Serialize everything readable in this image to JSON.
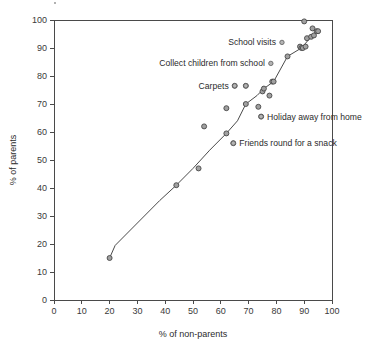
{
  "chart_data": {
    "type": "scatter",
    "title": "",
    "subtitle": "",
    "xlabel": "% of non-parents",
    "ylabel": "% of parents",
    "xlim": [
      0,
      100
    ],
    "ylim": [
      0,
      100
    ],
    "xticks": [
      "0",
      "10",
      "20",
      "30",
      "40",
      "50",
      "60",
      "70",
      "80",
      "90",
      "100"
    ],
    "yticks": [
      "0",
      "10",
      "20",
      "30",
      "40",
      "50",
      "60",
      "70",
      "80",
      "90",
      "100"
    ],
    "grid": false,
    "legend_position": "none",
    "marker_color": "#a0a0a0",
    "marker_edge_color": "#474747",
    "line_color": "#4a4a4a",
    "axis_color": "#4a4a4a",
    "series": [
      {
        "name": "activities",
        "points": [
          {
            "x": 20.0,
            "y": 15.0
          },
          {
            "x": 44.0,
            "y": 41.0
          },
          {
            "x": 52.0,
            "y": 47.0
          },
          {
            "x": 54.0,
            "y": 62.0
          },
          {
            "x": 62.0,
            "y": 59.5
          },
          {
            "x": 62.0,
            "y": 68.5
          },
          {
            "x": 64.5,
            "y": 56.0
          },
          {
            "x": 65.0,
            "y": 76.5
          },
          {
            "x": 69.0,
            "y": 76.5
          },
          {
            "x": 69.0,
            "y": 70.0
          },
          {
            "x": 73.5,
            "y": 69.0
          },
          {
            "x": 74.5,
            "y": 65.5
          },
          {
            "x": 75.0,
            "y": 74.5
          },
          {
            "x": 75.5,
            "y": 75.5
          },
          {
            "x": 77.5,
            "y": 73.0
          },
          {
            "x": 78.5,
            "y": 78.0
          },
          {
            "x": 79.0,
            "y": 78.0
          },
          {
            "x": 84.0,
            "y": 87.0
          },
          {
            "x": 88.5,
            "y": 90.5
          },
          {
            "x": 89.0,
            "y": 90.0
          },
          {
            "x": 89.5,
            "y": 90.0
          },
          {
            "x": 90.0,
            "y": 99.5
          },
          {
            "x": 90.5,
            "y": 90.5
          },
          {
            "x": 91.0,
            "y": 93.5
          },
          {
            "x": 92.5,
            "y": 94.0
          },
          {
            "x": 93.0,
            "y": 97.0
          },
          {
            "x": 93.5,
            "y": 94.5
          },
          {
            "x": 94.5,
            "y": 96.0
          },
          {
            "x": 95.0,
            "y": 96.0
          }
        ]
      }
    ],
    "trend_line": [
      {
        "x": 20.0,
        "y": 15.0
      },
      {
        "x": 22.0,
        "y": 19.5
      },
      {
        "x": 30.0,
        "y": 27.5
      },
      {
        "x": 38.0,
        "y": 35.5
      },
      {
        "x": 44.0,
        "y": 41.0
      },
      {
        "x": 50.0,
        "y": 47.0
      },
      {
        "x": 56.0,
        "y": 53.5
      },
      {
        "x": 62.0,
        "y": 59.5
      },
      {
        "x": 66.0,
        "y": 64.0
      },
      {
        "x": 69.0,
        "y": 70.0
      },
      {
        "x": 73.0,
        "y": 73.0
      },
      {
        "x": 75.5,
        "y": 75.5
      },
      {
        "x": 79.0,
        "y": 78.0
      },
      {
        "x": 84.0,
        "y": 87.0
      },
      {
        "x": 89.0,
        "y": 90.0
      },
      {
        "x": 92.5,
        "y": 94.0
      },
      {
        "x": 95.0,
        "y": 96.0
      }
    ],
    "annotations": [
      {
        "label": "School visits",
        "marker_x": 82.0,
        "marker_y": 92.0,
        "side": "left"
      },
      {
        "label": "Collect children from school",
        "marker_x": 78.0,
        "marker_y": 84.5,
        "side": "left"
      },
      {
        "label": "Carpets",
        "marker_x": 65.0,
        "marker_y": 76.5,
        "second_marker_x": 69.0,
        "second_marker_y": 76.5,
        "side": "left"
      },
      {
        "label": "Holiday away from home",
        "marker_x": 74.5,
        "marker_y": 65.5,
        "side": "right"
      },
      {
        "label": "Friends round for a snack",
        "marker_x": 64.5,
        "marker_y": 56.0,
        "side": "right"
      }
    ]
  }
}
